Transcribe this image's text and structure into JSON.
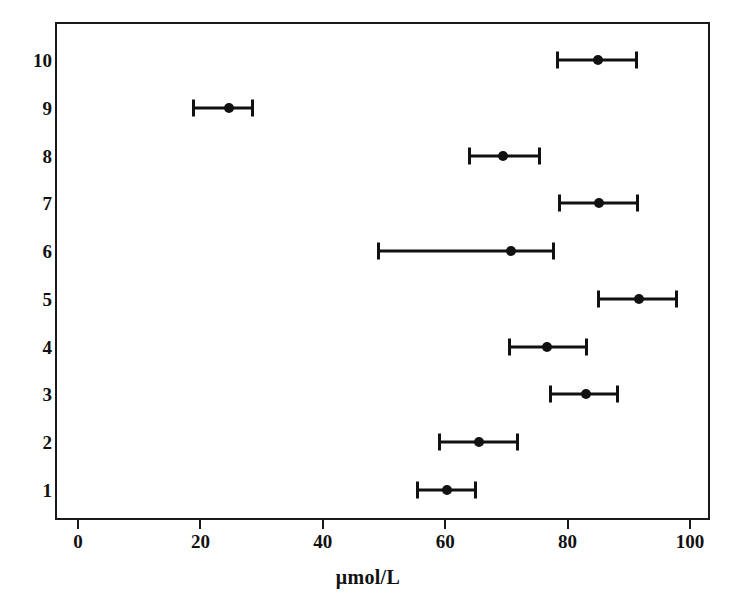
{
  "chart_data": {
    "type": "scatter",
    "title": "",
    "subtitle": "",
    "xlabel": "μmol/L",
    "ylabel": "",
    "xlim": [
      0,
      105
    ],
    "ylim": [
      0.4,
      10.6
    ],
    "grid": false,
    "legend": null,
    "orientation": "horizontal",
    "marker": "filled-circle",
    "error_bars": "horizontal-with-caps",
    "x_ticks": [
      0,
      20,
      40,
      60,
      80,
      100
    ],
    "x_tick_labels": [
      "0",
      "20",
      "40",
      "60",
      "80",
      "100"
    ],
    "y_ticks": [
      1,
      2,
      3,
      4,
      5,
      6,
      7,
      8,
      9,
      10
    ],
    "y_tick_labels": [
      "1",
      "2",
      "3",
      "4",
      "5",
      "6",
      "7",
      "8",
      "9",
      "10"
    ],
    "categories": [
      "1",
      "2",
      "3",
      "4",
      "5",
      "6",
      "7",
      "8",
      "9",
      "10"
    ],
    "values": [
      60.3,
      65.6,
      83.0,
      76.7,
      91.6,
      70.7,
      85.2,
      69.5,
      24.6,
      85.0
    ],
    "error_low": [
      55.2,
      58.8,
      77.0,
      70.2,
      84.8,
      48.9,
      78.4,
      63.8,
      18.7,
      78.1
    ],
    "error_high": [
      65.2,
      72.0,
      88.4,
      83.4,
      98.0,
      78.0,
      91.6,
      75.6,
      28.7,
      91.5
    ],
    "points": [
      {
        "category": "10",
        "y": 10,
        "value": 85.0,
        "low": 78.1,
        "high": 91.5
      },
      {
        "category": "9",
        "y": 9,
        "value": 24.6,
        "low": 18.7,
        "high": 28.7
      },
      {
        "category": "8",
        "y": 8,
        "value": 69.5,
        "low": 63.8,
        "high": 75.6
      },
      {
        "category": "7",
        "y": 7,
        "value": 85.2,
        "low": 78.4,
        "high": 91.6
      },
      {
        "category": "6",
        "y": 6,
        "value": 70.7,
        "low": 48.9,
        "high": 78.0
      },
      {
        "category": "5",
        "y": 5,
        "value": 91.6,
        "low": 84.8,
        "high": 98.0
      },
      {
        "category": "4",
        "y": 4,
        "value": 76.7,
        "low": 70.2,
        "high": 83.4
      },
      {
        "category": "3",
        "y": 3,
        "value": 83.0,
        "low": 77.0,
        "high": 88.4
      },
      {
        "category": "2",
        "y": 2,
        "value": 65.6,
        "low": 58.8,
        "high": 72.0
      },
      {
        "category": "1",
        "y": 1,
        "value": 60.3,
        "low": 55.2,
        "high": 65.2
      }
    ],
    "colors": {
      "marker": "#111111",
      "error_bar": "#111111",
      "axis": "#1a1a1a",
      "background": "#ffffff",
      "text": "#111111"
    }
  }
}
